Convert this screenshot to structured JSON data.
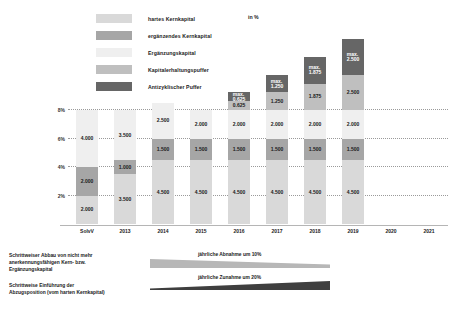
{
  "unit": "in %",
  "legend": {
    "items": [
      {
        "label": "hartes Kernkapital",
        "color": "#d9d9d9"
      },
      {
        "label": "ergänzendes Kernkapital",
        "color": "#a6a6a6"
      },
      {
        "label": "Ergänzungskapital",
        "color": "#efefef"
      },
      {
        "label": "Kapitalerhaltungspuffer",
        "color": "#bfbfbf"
      },
      {
        "label": "Antizyklischer Puffer",
        "color": "#666666"
      }
    ]
  },
  "chart_data": {
    "type": "bar",
    "stacked": true,
    "title": "",
    "xlabel": "",
    "ylabel": "in %",
    "ylim": [
      0,
      9
    ],
    "yticks": [
      "2%",
      "4%",
      "6%",
      "8%"
    ],
    "ytick_values": [
      2,
      4,
      6,
      8
    ],
    "grid": true,
    "legend_position": "top-left",
    "categories": [
      "SolvV",
      "2013",
      "2014",
      "2015",
      "2016",
      "2017",
      "2018",
      "2019",
      "2020",
      "2021"
    ],
    "series": [
      {
        "name": "hartes Kernkapital",
        "color": "#d9d9d9",
        "values": [
          2.0,
          3.5,
          4.5,
          4.5,
          4.5,
          4.5,
          4.5,
          4.5,
          null,
          null
        ],
        "labels": [
          "2.000",
          "3.500",
          "4.500",
          "4.500",
          "4.500",
          "4.500",
          "4.500",
          "4.500",
          "",
          ""
        ]
      },
      {
        "name": "ergänzendes Kernkapital",
        "color": "#a6a6a6",
        "values": [
          2.0,
          1.0,
          1.5,
          1.5,
          1.5,
          1.5,
          1.5,
          1.5,
          null,
          null
        ],
        "labels": [
          "2.000",
          "1.000",
          "1.500",
          "1.500",
          "1.500",
          "1.500",
          "1.500",
          "1.500",
          "",
          ""
        ]
      },
      {
        "name": "Ergänzungskapital",
        "color": "#efefef",
        "values": [
          4.0,
          3.5,
          2.5,
          2.0,
          2.0,
          2.0,
          2.0,
          2.0,
          null,
          null
        ],
        "labels": [
          "4.000",
          "3.500",
          "2.500",
          "2.000",
          "2.000",
          "2.000",
          "2.000",
          "2.000",
          "",
          ""
        ]
      },
      {
        "name": "Kapitalerhaltungspuffer",
        "color": "#bfbfbf",
        "values": [
          null,
          null,
          null,
          null,
          0.625,
          1.25,
          1.875,
          2.5,
          null,
          null
        ],
        "labels": [
          "",
          "",
          "",
          "",
          "0.625",
          "1.250",
          "1.875",
          "2.500",
          "",
          ""
        ]
      },
      {
        "name": "Antizyklischer Puffer",
        "color": "#666666",
        "values": [
          null,
          null,
          null,
          null,
          0.625,
          1.25,
          1.875,
          2.5,
          null,
          null
        ],
        "labels": [
          "",
          "",
          "",
          "",
          "0.625",
          "1.250",
          "1.875",
          "2.500",
          "",
          ""
        ],
        "max_prefix": "max."
      }
    ]
  },
  "footnotes": {
    "left": [
      {
        "lines": [
          "Schrittweiser Abbau von nicht mehr",
          "anerkennungsfähigen Kern- bzw.",
          "Ergänzungskapital"
        ]
      },
      {
        "lines": [
          "Schrittweise Einführung der",
          "Abzugsposition (vom harten Kernkapital)"
        ]
      }
    ],
    "arrows": [
      {
        "text": "jährliche Abnahme um 10%",
        "direction": "decrease"
      },
      {
        "text": "jährliche Zunahme um 20%",
        "direction": "increase"
      }
    ]
  }
}
